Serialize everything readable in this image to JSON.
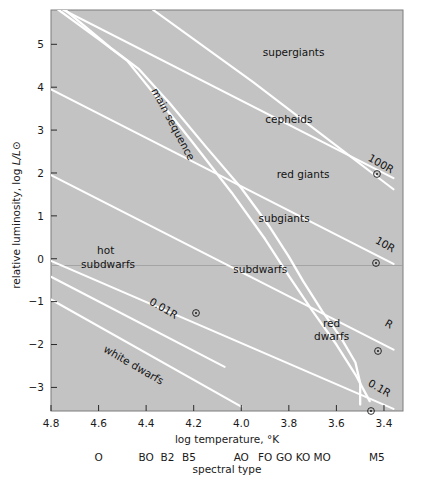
{
  "chart_data": {
    "type": "line",
    "title": "",
    "xlabel": "log temperature, °K",
    "ylabel": "relative luminosity, log L/L⊙",
    "secondary_xlabel": "spectral type",
    "xlim": [
      4.8,
      3.32
    ],
    "ylim": [
      -3.55,
      5.8
    ],
    "x_ticks": [
      "4.8",
      "4.6",
      "4.4",
      "4.2",
      "4.0",
      "3.8",
      "3.6",
      "3.4"
    ],
    "x_tick_values": [
      4.8,
      4.6,
      4.4,
      4.2,
      4.0,
      3.8,
      3.6,
      3.4
    ],
    "y_ticks": [
      "5",
      "4",
      "3",
      "2",
      "1",
      "0",
      "−1",
      "−2",
      "−3"
    ],
    "y_tick_values": [
      5,
      4,
      3,
      2,
      1,
      0,
      -1,
      -2,
      -3
    ],
    "grid": false,
    "legend": "none",
    "plot_background": "#c3c3c3",
    "curve_color": "#ffffff",
    "zero_line_color": "#9a9a9a",
    "spectral_types": [
      {
        "label": "O",
        "x": 4.6
      },
      {
        "label": "BO",
        "x": 4.4
      },
      {
        "label": "B2",
        "x": 4.31
      },
      {
        "label": "B5",
        "x": 4.22
      },
      {
        "label": "AO",
        "x": 4.0
      },
      {
        "label": "FO",
        "x": 3.9
      },
      {
        "label": "GO",
        "x": 3.82
      },
      {
        "label": "KO",
        "x": 3.74
      },
      {
        "label": "MO",
        "x": 3.66
      },
      {
        "label": "M5",
        "x": 3.43
      }
    ],
    "region_labels": [
      {
        "text": "supergiants",
        "x": 3.78,
        "y": 4.72,
        "rotation": 0
      },
      {
        "text": "cepheids",
        "x": 3.8,
        "y": 3.16,
        "rotation": 0
      },
      {
        "text": "red giants",
        "x": 3.74,
        "y": 1.88,
        "rotation": 0
      },
      {
        "text": "subgiants",
        "x": 3.82,
        "y": 0.86,
        "rotation": 0
      },
      {
        "text": "subdwarfs",
        "x": 3.92,
        "y": -0.34,
        "rotation": 0
      },
      {
        "text": "hot",
        "x": 4.57,
        "y": 0.12,
        "rotation": 0
      },
      {
        "text": "subdwarfs",
        "x": 4.56,
        "y": -0.22,
        "rotation": 0
      },
      {
        "text": "red",
        "x": 3.62,
        "y": -1.58,
        "rotation": 0
      },
      {
        "text": "dwarfs",
        "x": 3.62,
        "y": -1.9,
        "rotation": 0
      },
      {
        "text": "main sequence",
        "x": 4.3,
        "y": 3.1,
        "rotation": 62
      },
      {
        "text": "white dwarfs",
        "x": 4.46,
        "y": -2.55,
        "rotation": 30
      },
      {
        "text": "0.01R",
        "x": 4.39,
        "y": -1.05,
        "rotation": 30
      },
      {
        "text": "0.1R",
        "x": 3.47,
        "y": -2.95,
        "rotation": 30
      },
      {
        "text": "R",
        "x": 3.4,
        "y": -1.55,
        "rotation": 30
      },
      {
        "text": "10R",
        "x": 3.44,
        "y": 0.38,
        "rotation": 30
      },
      {
        "text": "100R",
        "x": 3.47,
        "y": 2.3,
        "rotation": 30
      }
    ],
    "series": [
      {
        "name": "radius-100R",
        "kind": "constant-radius-line",
        "points": [
          [
            4.8,
            5.95
          ],
          [
            3.36,
            1.88
          ]
        ]
      },
      {
        "name": "radius-10R",
        "kind": "constant-radius-line",
        "points": [
          [
            4.8,
            3.95
          ],
          [
            3.36,
            -0.12
          ]
        ]
      },
      {
        "name": "radius-R",
        "kind": "constant-radius-line",
        "points": [
          [
            4.8,
            1.95
          ],
          [
            3.36,
            -2.12
          ]
        ]
      },
      {
        "name": "radius-0.1R",
        "kind": "constant-radius-line",
        "points": [
          [
            4.8,
            -0.05
          ],
          [
            3.36,
            -3.5
          ]
        ]
      },
      {
        "name": "radius-0.01R",
        "kind": "constant-radius-line",
        "points": [
          [
            4.8,
            -0.42
          ],
          [
            4.07,
            -2.52
          ]
        ]
      },
      {
        "name": "white-dwarfs-lower",
        "kind": "band-edge",
        "points": [
          [
            4.8,
            -0.95
          ],
          [
            4.0,
            -3.45
          ]
        ]
      },
      {
        "name": "main-sequence-upper",
        "kind": "main-sequence",
        "points": [
          [
            4.74,
            5.8
          ],
          [
            4.55,
            4.92
          ],
          [
            4.43,
            4.42
          ],
          [
            4.3,
            3.62
          ],
          [
            4.15,
            2.62
          ],
          [
            4.0,
            1.65
          ],
          [
            3.88,
            0.74
          ],
          [
            3.8,
            0.05
          ],
          [
            3.74,
            -0.52
          ],
          [
            3.66,
            -1.22
          ],
          [
            3.58,
            -1.85
          ],
          [
            3.52,
            -2.42
          ],
          [
            3.5,
            -2.9
          ],
          [
            3.5,
            -3.4
          ]
        ]
      },
      {
        "name": "main-sequence-lower",
        "kind": "main-sequence",
        "points": [
          [
            4.78,
            5.85
          ],
          [
            4.6,
            5.12
          ],
          [
            4.48,
            4.62
          ],
          [
            4.36,
            3.8
          ],
          [
            4.2,
            2.68
          ],
          [
            4.04,
            1.54
          ],
          [
            3.9,
            0.46
          ],
          [
            3.8,
            -0.4
          ],
          [
            3.7,
            -1.22
          ],
          [
            3.6,
            -2.0
          ],
          [
            3.52,
            -2.7
          ],
          [
            3.46,
            -3.32
          ]
        ]
      },
      {
        "name": "giant-branch",
        "kind": "band-edge",
        "points": [
          [
            4.4,
            5.92
          ],
          [
            3.95,
            4.12
          ],
          [
            3.62,
            2.72
          ],
          [
            3.36,
            1.62
          ]
        ]
      }
    ],
    "sun-symbol": "⊙"
  }
}
